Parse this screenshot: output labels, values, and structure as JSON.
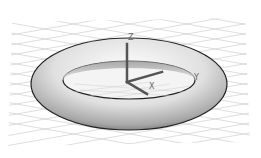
{
  "scene": {
    "object": "torus",
    "background_color": "#ffffff",
    "grid_color": "#c8c8c8",
    "torus_outline_color": "#222222",
    "axis_color": "#555555"
  },
  "axes": {
    "x_label": "X",
    "y_label": "Y",
    "z_label": "Z"
  }
}
